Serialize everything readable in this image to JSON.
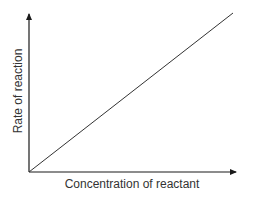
{
  "chart_data": {
    "type": "line",
    "title": "",
    "xlabel": "Concentration of reactant",
    "ylabel": "Rate of reaction",
    "x": [
      0,
      1
    ],
    "series": [
      {
        "name": "Rate",
        "values": [
          0,
          1
        ]
      }
    ],
    "xlim": [
      0,
      1
    ],
    "ylim": [
      0,
      1
    ],
    "grid": false,
    "legend": null,
    "annotations": []
  },
  "colors": {
    "axis": "#1a1a1a",
    "line": "#333333"
  }
}
